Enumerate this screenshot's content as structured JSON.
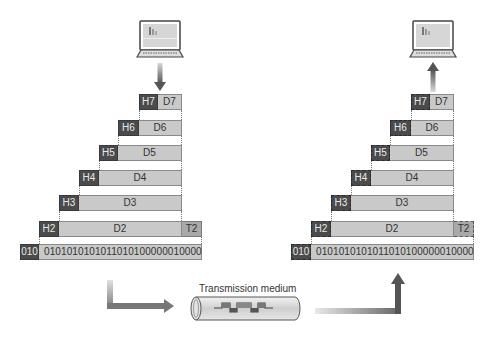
{
  "diagram": {
    "medium_label": "Transmission medium",
    "sender": {
      "device_icon": "laptop-icon",
      "layers": [
        {
          "header": "H7",
          "data": "D7"
        },
        {
          "header": "H6",
          "data": "D6"
        },
        {
          "header": "H5",
          "data": "D5"
        },
        {
          "header": "H4",
          "data": "D4"
        },
        {
          "header": "H3",
          "data": "D3"
        },
        {
          "header": "H2",
          "data": "D2",
          "trailer": "T2"
        },
        {
          "header": "010",
          "data": "0101010101011010100000010000"
        }
      ]
    },
    "receiver": {
      "device_icon": "laptop-icon",
      "layers": [
        {
          "header": "H7",
          "data": "D7"
        },
        {
          "header": "H6",
          "data": "D6"
        },
        {
          "header": "H5",
          "data": "D5"
        },
        {
          "header": "H4",
          "data": "D4"
        },
        {
          "header": "H3",
          "data": "D3"
        },
        {
          "header": "H2",
          "data": "D2",
          "trailer": "T2"
        },
        {
          "header": "010",
          "data": "0101010101011010100000010000"
        }
      ]
    },
    "colors": {
      "header": "#4b4b4b",
      "data": "#c9c9c9",
      "trailer": "#a9a9a9",
      "arrow": "#6a6a6a"
    }
  }
}
